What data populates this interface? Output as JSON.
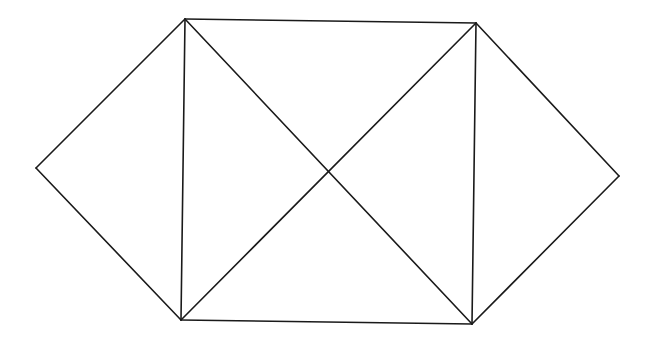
{
  "diagram": {
    "type": "line-drawing",
    "stroke_color": "#1a1a1a",
    "background": "#ffffff",
    "vertices": {
      "A_left": [
        36,
        168
      ],
      "B_top_left": [
        185,
        19
      ],
      "C_top_right": [
        476,
        23
      ],
      "D_right": [
        619,
        176
      ],
      "E_bottom_right": [
        472,
        324
      ],
      "F_bottom_left": [
        181,
        320
      ]
    },
    "edges": [
      [
        "A_left",
        "B_top_left"
      ],
      [
        "A_left",
        "F_bottom_left"
      ],
      [
        "B_top_left",
        "C_top_right"
      ],
      [
        "F_bottom_left",
        "E_bottom_right"
      ],
      [
        "B_top_left",
        "F_bottom_left"
      ],
      [
        "C_top_right",
        "E_bottom_right"
      ],
      [
        "B_top_left",
        "E_bottom_right"
      ],
      [
        "F_bottom_left",
        "C_top_right"
      ],
      [
        "C_top_right",
        "D_right"
      ],
      [
        "D_right",
        "E_bottom_right"
      ]
    ]
  }
}
